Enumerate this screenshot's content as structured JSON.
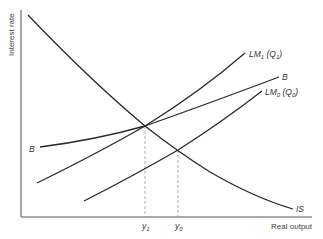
{
  "diagram": {
    "type": "IS-LM diagram",
    "axes": {
      "y_label": "Interest rate",
      "x_label": "Real output"
    },
    "curves": {
      "IS": {
        "label": "IS"
      },
      "LM1": {
        "label": "LM",
        "sub": "1",
        "paren_open": " (Q",
        "paren_sub": "1",
        "paren_close": ")"
      },
      "LM0": {
        "label": "LM",
        "sub": "0",
        "paren_open": " (Q",
        "paren_sub": "0",
        "paren_close": ")"
      },
      "B": {
        "label": "B",
        "left_label": "B"
      }
    },
    "x_ticks": {
      "y1": {
        "label": "y",
        "sub": "1"
      },
      "y0": {
        "label": "y",
        "sub": "0"
      }
    },
    "colors": {
      "curve": "#2a2a2a",
      "axis": "#555555",
      "dashed": "#999999"
    }
  }
}
